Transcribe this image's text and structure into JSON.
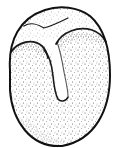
{
  "figure": {
    "caption": "",
    "colors": {
      "background": "#ffffff",
      "ink": "#1a1a1a",
      "stipple": "#4a4a4a"
    }
  }
}
